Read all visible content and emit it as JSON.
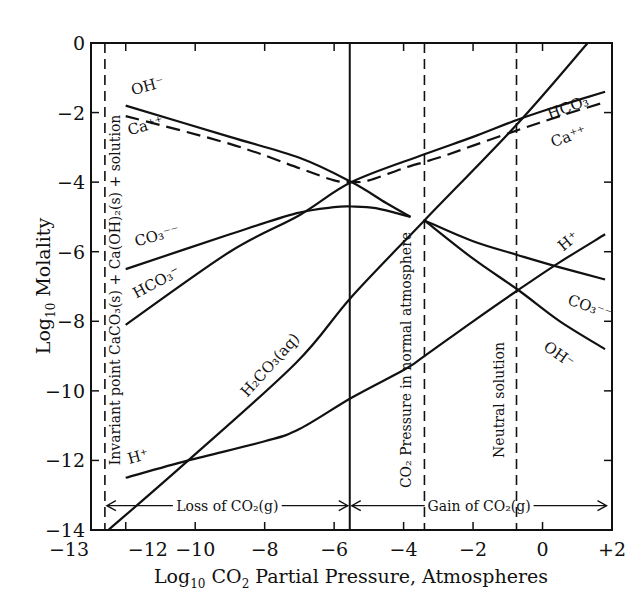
{
  "chart_data": {
    "type": "line",
    "title": "",
    "xlabel": "Log10 CO2 Partial Pressure, Atmospheres",
    "ylabel": "Log10 Molality",
    "xlim": [
      -13,
      2
    ],
    "ylim": [
      -14,
      0
    ],
    "x_ticks": [
      -13,
      -12,
      -10,
      -8,
      -6,
      -4,
      -2,
      0,
      2
    ],
    "x_tick_labels": [
      "-13",
      "-12",
      "-10",
      "-8",
      "-6",
      "-4",
      "-2",
      "0",
      "+2"
    ],
    "y_ticks": [
      0,
      -2,
      -4,
      -6,
      -8,
      -10,
      -12,
      -14
    ],
    "y_tick_labels": [
      "0",
      "-2",
      "-4",
      "-6",
      "-8",
      "-10",
      "-12",
      "-14"
    ],
    "grid": false,
    "series": [
      {
        "name": "OH⁻ (left branch)",
        "style": "solid",
        "x": [
          -12,
          -9,
          -7,
          -5.5,
          -4.5,
          -3.8
        ],
        "y": [
          -1.8,
          -2.7,
          -3.3,
          -4.0,
          -4.6,
          -5.0
        ]
      },
      {
        "name": "OH⁻ (right branch)",
        "style": "solid",
        "x": [
          -3.4,
          -2,
          -0.7,
          0.5,
          1.8
        ],
        "y": [
          -5.1,
          -6.2,
          -7.1,
          -8.0,
          -8.8
        ]
      },
      {
        "name": "Ca⁺⁺",
        "style": "dashed",
        "x": [
          -12,
          -9,
          -7,
          -6,
          -5.5,
          -5,
          -4,
          -3,
          -2,
          -0.7,
          0.5,
          1.8
        ],
        "y": [
          -2.1,
          -2.9,
          -3.6,
          -3.95,
          -4.0,
          -3.95,
          -3.6,
          -3.3,
          -2.95,
          -2.5,
          -2.1,
          -1.7
        ]
      },
      {
        "name": "HCO₃⁻",
        "style": "solid",
        "x": [
          -12,
          -9,
          -7,
          -5.5,
          -3.4,
          -2,
          -0.7,
          0.5,
          1.8
        ],
        "y": [
          -8.1,
          -6.0,
          -4.95,
          -4.0,
          -3.2,
          -2.7,
          -2.2,
          -1.8,
          -1.4
        ]
      },
      {
        "name": "CO₃⁻⁻ (left branch)",
        "style": "solid",
        "x": [
          -12,
          -9,
          -7.1,
          -6,
          -5.5,
          -4.8,
          -3.8
        ],
        "y": [
          -6.5,
          -5.5,
          -4.9,
          -4.72,
          -4.7,
          -4.75,
          -5.0
        ]
      },
      {
        "name": "CO₃⁻⁻ (right branch)",
        "style": "solid",
        "x": [
          -3.4,
          -2,
          -0.7,
          0.5,
          1.8
        ],
        "y": [
          -5.1,
          -5.7,
          -6.1,
          -6.45,
          -6.8
        ]
      },
      {
        "name": "H₂CO₃(aq)",
        "style": "solid",
        "x": [
          -12.5,
          -10.2,
          -7.1,
          -5.5,
          -3.4,
          -0.7,
          1.3
        ],
        "y": [
          -14,
          -12.0,
          -9.2,
          -7.3,
          -5.1,
          -2.3,
          0
        ]
      },
      {
        "name": "H⁺",
        "style": "solid",
        "x": [
          -12,
          -10.2,
          -8,
          -7,
          -5.5,
          -4,
          -3.4,
          -2,
          -0.7,
          0.5,
          1.8
        ],
        "y": [
          -12.5,
          -12.0,
          -11.45,
          -11.1,
          -10.2,
          -9.4,
          -9.0,
          -8.0,
          -7.1,
          -6.3,
          -5.5
        ]
      }
    ],
    "vertical_lines": [
      {
        "x": -12.6,
        "style": "dashed",
        "label": "Invariant point CaCO₃(s) + Ca(OH)₂(s) + solution"
      },
      {
        "x": -5.55,
        "style": "solid",
        "label": ""
      },
      {
        "x": -3.4,
        "style": "dashed",
        "label": "CO₂ Pressure in normal atmosphere"
      },
      {
        "x": -0.75,
        "style": "dashed",
        "label": "Neutral solution"
      }
    ],
    "annotations": [
      {
        "text": "Loss of CO₂(g)",
        "x_from": -12.6,
        "x_to": -5.55,
        "y": -13.3
      },
      {
        "text": "Gain of CO₂(g)",
        "x_from": -5.55,
        "x_to": 1.9,
        "y": -13.3
      }
    ],
    "species_labels": [
      {
        "text": "OH⁻",
        "x": -11.8,
        "y": -1.5,
        "rot": -15
      },
      {
        "text": "Ca⁺⁺",
        "x": -11.9,
        "y": -2.65,
        "rot": -15
      },
      {
        "text": "CO₃⁻⁻",
        "x": -11.7,
        "y": -5.85,
        "rot": -15
      },
      {
        "text": "HCO₃⁻",
        "x": -11.7,
        "y": -7.35,
        "rot": -28
      },
      {
        "text": "H₂CO₃(aq)",
        "x": -8.5,
        "y": -10.2,
        "rot": -48
      },
      {
        "text": "H⁺",
        "x": -11.9,
        "y": -12.1,
        "rot": -15
      },
      {
        "text": "HCO₃⁻",
        "x": 0.2,
        "y": -2.2,
        "rot": -20
      },
      {
        "text": "Ca⁺⁺",
        "x": 0.3,
        "y": -3.0,
        "rot": -20
      },
      {
        "text": "H⁺",
        "x": 0.6,
        "y": -6.0,
        "rot": -40
      },
      {
        "text": "CO₃⁻⁻",
        "x": 0.7,
        "y": -7.5,
        "rot": 20
      },
      {
        "text": "OH⁻",
        "x": 0.0,
        "y": -8.8,
        "rot": 35
      }
    ]
  },
  "labels": {
    "ylabel_main": "Log",
    "ylabel_sub": "10",
    "ylabel_rest": " Molality",
    "xlabel_main": "Log",
    "xlabel_sub": "10",
    "xlabel_co": " CO",
    "xlabel_co_sub": "2",
    "xlabel_rest": " Partial Pressure, Atmospheres",
    "loss": "Loss of CO₂(g)",
    "gain": "Gain of CO₂(g)",
    "invariant": "Invariant point CaCO₃(s) + Ca(OH)₂(s) + solution",
    "atmosphere": "CO₂ Pressure in normal atmosphere",
    "neutral": "Neutral solution"
  }
}
